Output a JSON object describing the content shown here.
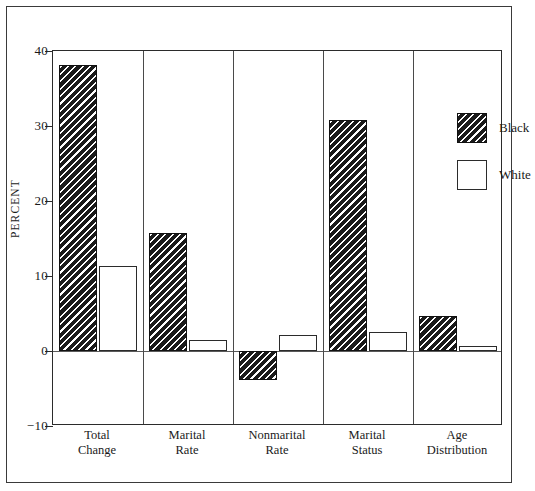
{
  "chart_data": {
    "type": "bar",
    "title": "",
    "subtitle": "",
    "xlabel": "",
    "ylabel": "PERCENT",
    "ylim": [
      -10,
      40
    ],
    "yticks": [
      40,
      30,
      20,
      10,
      0,
      -10
    ],
    "ytick_labels": [
      "40",
      "30",
      "20",
      "10",
      "0",
      "−10"
    ],
    "grid": false,
    "legend_position": "top-right",
    "zero_line": true,
    "group_separators": true,
    "categories": [
      "Total Change",
      "Marital Rate",
      "Nonmarital Rate",
      "Marital Status",
      "Age Distribution"
    ],
    "category_lines": [
      [
        "Total",
        "Change"
      ],
      [
        "Marital",
        "Rate"
      ],
      [
        "Nonmarital",
        "Rate"
      ],
      [
        "Marital",
        "Status"
      ],
      [
        "Age",
        "Distribution"
      ]
    ],
    "series": [
      {
        "name": "Black",
        "fill": "hatched",
        "color": "#1b1b1b",
        "values": [
          38.1,
          15.8,
          -3.8,
          30.8,
          4.7
        ]
      },
      {
        "name": "White",
        "fill": "solid",
        "color": "#ffffff",
        "values": [
          11.4,
          1.5,
          2.2,
          2.6,
          0.7
        ]
      }
    ]
  },
  "legend": {
    "items": [
      {
        "label": "Black",
        "swatch": "hatched-swatch"
      },
      {
        "label": "White",
        "swatch": "white-swatch"
      }
    ]
  },
  "colors": {
    "frame": "#2b2b2b",
    "zero_line": "#5a5a5a",
    "separator": "#4a4a4a",
    "bar_black": "#1b1b1b",
    "bar_white": "#ffffff",
    "text": "#1a1a1a",
    "background": "#ffffff"
  }
}
